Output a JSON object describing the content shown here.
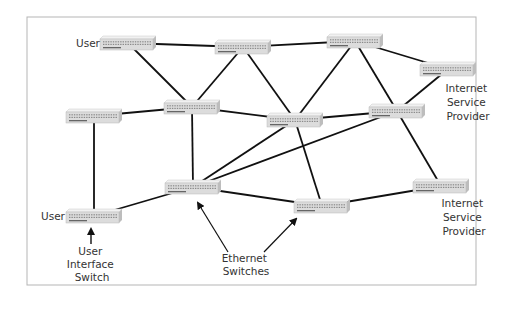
{
  "diagram": {
    "type": "network-topology",
    "frame": {
      "x": 27,
      "y": 17,
      "width": 449,
      "height": 268,
      "stroke": "#b5b5b5"
    },
    "colors": {
      "link": "#111111",
      "switch_top": "#f1f1f1",
      "switch_front": "#dcdcdc",
      "switch_side": "#bdbdbd",
      "text": "#333333"
    },
    "nodes": [
      {
        "id": "s1",
        "kind": "ethernet-switch",
        "x": 128,
        "y": 43,
        "role": "user"
      },
      {
        "id": "s2",
        "kind": "ethernet-switch",
        "x": 243,
        "y": 47
      },
      {
        "id": "s3",
        "kind": "ethernet-switch",
        "x": 355,
        "y": 41
      },
      {
        "id": "s4",
        "kind": "ethernet-switch",
        "x": 448,
        "y": 69,
        "role": "isp"
      },
      {
        "id": "s5",
        "kind": "ethernet-switch",
        "x": 94,
        "y": 116
      },
      {
        "id": "s6",
        "kind": "ethernet-switch",
        "x": 192,
        "y": 107
      },
      {
        "id": "s7",
        "kind": "ethernet-switch",
        "x": 295,
        "y": 120
      },
      {
        "id": "s8",
        "kind": "ethernet-switch",
        "x": 397,
        "y": 111
      },
      {
        "id": "s9",
        "kind": "ethernet-switch",
        "x": 193,
        "y": 187
      },
      {
        "id": "s10",
        "kind": "ethernet-switch",
        "x": 322,
        "y": 206
      },
      {
        "id": "s11",
        "kind": "ethernet-switch",
        "x": 441,
        "y": 186,
        "role": "isp"
      },
      {
        "id": "s12",
        "kind": "ethernet-switch",
        "x": 94,
        "y": 216,
        "role": "user"
      }
    ],
    "edges": [
      [
        "s1",
        "s2"
      ],
      [
        "s1",
        "s6"
      ],
      [
        "s2",
        "s3"
      ],
      [
        "s2",
        "s6"
      ],
      [
        "s2",
        "s7"
      ],
      [
        "s3",
        "s7"
      ],
      [
        "s3",
        "s8"
      ],
      [
        "s3",
        "s4"
      ],
      [
        "s4",
        "s8"
      ],
      [
        "s5",
        "s6"
      ],
      [
        "s5",
        "s12"
      ],
      [
        "s6",
        "s7"
      ],
      [
        "s6",
        "s9"
      ],
      [
        "s7",
        "s8"
      ],
      [
        "s7",
        "s9"
      ],
      [
        "s7",
        "s10"
      ],
      [
        "s8",
        "s9"
      ],
      [
        "s8",
        "s11"
      ],
      [
        "s9",
        "s12"
      ],
      [
        "s9",
        "s10"
      ],
      [
        "s10",
        "s11"
      ]
    ],
    "labels": {
      "user_top": "User",
      "user_bottom": "User",
      "isp_top": [
        "Internet",
        "Service",
        "Provider"
      ],
      "isp_bottom": [
        "Internet",
        "Service",
        "Provider"
      ],
      "user_interface_switch": [
        "User",
        "Interface",
        "Switch"
      ],
      "ethernet_switches": [
        "Ethernet",
        "Switches"
      ]
    }
  }
}
